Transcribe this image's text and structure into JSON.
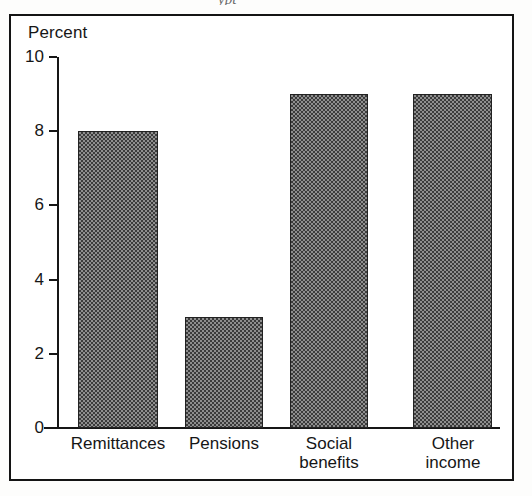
{
  "figure": {
    "title_fragment": "ypt",
    "axis_label": "Percent"
  },
  "chart_data": {
    "type": "bar",
    "title": "",
    "xlabel": "",
    "ylabel": "Percent",
    "ylim": [
      0,
      10
    ],
    "yticks": [
      0,
      2,
      4,
      6,
      8,
      10
    ],
    "grid": false,
    "legend": "none",
    "categories": [
      "Remittances",
      "Pensions",
      "Social benefits",
      "Other income"
    ],
    "category_lines": [
      [
        "Remittances"
      ],
      [
        "Pensions"
      ],
      [
        "Social",
        "benefits"
      ],
      [
        "Other",
        "income"
      ]
    ],
    "values": [
      8,
      3,
      9,
      9
    ],
    "bar_fill": "#8e8e8e",
    "bar_pattern": "checkerboard-dither",
    "bar_edge": "#222222"
  }
}
